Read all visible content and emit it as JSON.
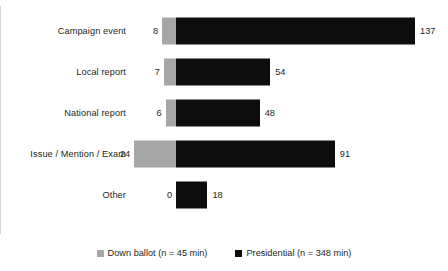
{
  "chart_data": {
    "type": "bar",
    "orientation": "horizontal",
    "style": "diverging-back-to-back",
    "title": "",
    "subtitle": "",
    "xlabel": "",
    "ylabel": "",
    "grid": false,
    "axis_zero_label": "0",
    "legend_position": "bottom-center",
    "categories": [
      "Campaign event",
      "Local report",
      "National report",
      "Issue / Mention / Exam",
      "Other"
    ],
    "series": [
      {
        "name": "Down ballot (n = 45 min)",
        "direction": "left",
        "color": "#a6a6a6",
        "values": [
          8,
          7,
          6,
          24,
          0
        ],
        "labels": [
          "8",
          "7",
          "6",
          "24",
          "0"
        ]
      },
      {
        "name": "Presidential (n = 348 min)",
        "direction": "right",
        "color": "#0d0d0d",
        "values": [
          137,
          54,
          48,
          91,
          18
        ],
        "labels": [
          "137",
          "54",
          "48",
          "91",
          "18"
        ]
      }
    ],
    "xlim": [
      -30,
      150
    ],
    "px_per_unit": 1.745,
    "zero_x_px": 176
  },
  "legend": {
    "items": [
      {
        "label": "Down ballot (n = 45 min)",
        "swatch": "down-ballot-swatch",
        "color": "#a6a6a6"
      },
      {
        "label": "Presidential (n = 348 min)",
        "swatch": "presidential-swatch",
        "color": "#0d0d0d"
      }
    ]
  },
  "rows": [
    {
      "category": "Campaign event",
      "neg_label": "8",
      "pos_label": "137",
      "neg": 8,
      "pos": 137
    },
    {
      "category": "Local report",
      "neg_label": "7",
      "pos_label": "54",
      "neg": 7,
      "pos": 54
    },
    {
      "category": "National report",
      "neg_label": "6",
      "pos_label": "48",
      "neg": 6,
      "pos": 48
    },
    {
      "category": "Issue / Mention / Exam",
      "neg_label": "24",
      "pos_label": "91",
      "neg": 24,
      "pos": 91
    },
    {
      "category": "Other",
      "neg_label": "0",
      "pos_label": "18",
      "neg": 0,
      "pos": 18
    }
  ]
}
